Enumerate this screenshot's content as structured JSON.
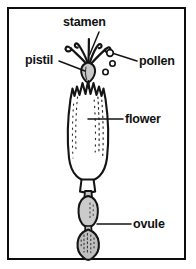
{
  "figure": {
    "kind": "botanical-diagram",
    "frame_color": "#0d0d0d",
    "background_color": "#ffffff",
    "line_color": "#111111",
    "fill_color": "#cfcfcf"
  },
  "labels": {
    "stamen": "stamen",
    "pistil": "pistil",
    "pollen": "pollen",
    "flower": "flower",
    "ovule": "ovule"
  },
  "parts": [
    {
      "name": "stamen",
      "label": "stamen",
      "leader_from": [
        100,
        33
      ],
      "leader_to": [
        88,
        54
      ]
    },
    {
      "name": "pistil",
      "label": "pistil",
      "leader_from": [
        60,
        61
      ],
      "leader_to": [
        88,
        70
      ]
    },
    {
      "name": "pollen",
      "label": "pollen",
      "leader_from": [
        136,
        61
      ],
      "leader_to": [
        110,
        54
      ]
    },
    {
      "name": "flower",
      "label": "flower",
      "leader_from": [
        122,
        119
      ],
      "leader_to": [
        88,
        119
      ]
    },
    {
      "name": "ovule",
      "label": "ovule",
      "leader_from": [
        130,
        224
      ],
      "leader_to": [
        98,
        224
      ]
    }
  ],
  "pollen_grains": [
    {
      "cx": 110,
      "cy": 53,
      "r": 3.2
    },
    {
      "cx": 112,
      "cy": 63,
      "r": 2.6
    },
    {
      "cx": 105,
      "cy": 72,
      "r": 2.6
    }
  ]
}
